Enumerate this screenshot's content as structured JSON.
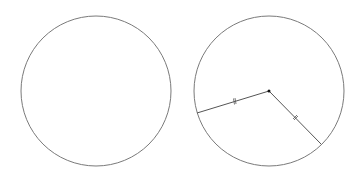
{
  "diagram": {
    "stroke_color": "#7a7a7a",
    "radius_color": "#555555",
    "dot_color": "#111111",
    "circles": [
      {
        "id": "left",
        "cx": 96,
        "cy": 91,
        "r": 75,
        "radii": []
      },
      {
        "id": "right",
        "cx": 269,
        "cy": 91,
        "r": 75,
        "center_dot": true,
        "radii": [
          {
            "x2": 197,
            "y2": 113,
            "tick": "double"
          },
          {
            "x2": 321,
            "y2": 144,
            "tick": "double"
          }
        ]
      }
    ]
  }
}
